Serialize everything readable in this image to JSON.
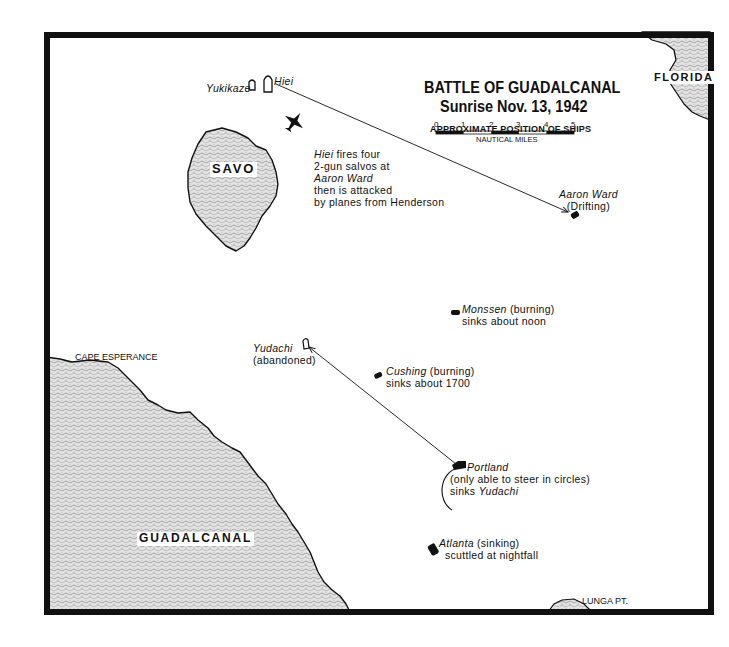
{
  "title": {
    "line1": "BATTLE OF GUADALCANAL",
    "line2": "Sunrise Nov. 13, 1942",
    "subtitle": "APPROXIMATE POSITION OF SHIPS"
  },
  "scale_bar": {
    "ticks": [
      "0",
      "1",
      "2",
      "3",
      "4",
      "5"
    ],
    "unit_label": "NAUTICAL MILES"
  },
  "land": {
    "savo": "SAVO",
    "florida": "FLORIDA",
    "guadalcanal": "GUADALCANAL",
    "cape_esperance": "CAPE ESPERANCE",
    "lunga_pt": "LUNGA PT."
  },
  "ships": {
    "yukikaze": {
      "name": "Yukikaze"
    },
    "hiei": {
      "name": "Hiei",
      "note_name": "Hiei",
      "note_line1": " fires four",
      "note_line2": "2-gun salvos at",
      "note_line3": "Aaron Ward",
      "note_line4": "then is attacked",
      "note_line5": "by planes from Henderson"
    },
    "aaron_ward": {
      "name": "Aaron Ward",
      "status": "(Drifting)"
    },
    "monssen": {
      "name": "Monssen",
      "status": " (burning)",
      "fate": "sinks about noon"
    },
    "yudachi": {
      "name": "Yudachi",
      "status": "(abandoned)"
    },
    "cushing": {
      "name": "Cushing",
      "status": " (burning)",
      "fate": "sinks about 1700"
    },
    "portland": {
      "name": "Portland",
      "status": "(only able to steer in circles)",
      "fate_prefix": "sinks ",
      "fate_target": "Yudachi"
    },
    "atlanta": {
      "name": "Atlanta",
      "status": " (sinking)",
      "fate": "scuttled at nightfall"
    }
  },
  "icons": {
    "aircraft": "plane-icon",
    "friendly_ship": "filled-ship-icon",
    "enemy_ship": "outline-ship-icon"
  },
  "colors": {
    "ink": "#111111",
    "land_fill": "#d9d9d9",
    "water": "#ffffff"
  }
}
